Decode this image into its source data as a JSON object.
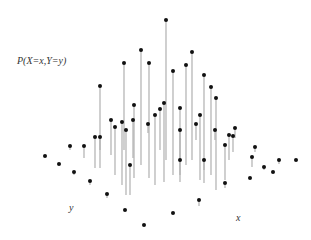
{
  "chart_data": {
    "type": "stem3d",
    "title": "",
    "zlabel": "P(X=x,Y=y)",
    "xlabel": "x",
    "ylabel": "y",
    "grid": false,
    "stem_color": "#b0b0b0",
    "marker_color": "#111111",
    "points": [
      {
        "x": 166,
        "top": 20,
        "base": 160
      },
      {
        "x": 141,
        "top": 50,
        "base": 165
      },
      {
        "x": 192,
        "top": 52,
        "base": 160
      },
      {
        "x": 124,
        "top": 63,
        "base": 150
      },
      {
        "x": 186,
        "top": 65,
        "base": 165
      },
      {
        "x": 173,
        "top": 71,
        "base": 175
      },
      {
        "x": 204,
        "top": 75,
        "base": 170
      },
      {
        "x": 149,
        "top": 63,
        "base": 178
      },
      {
        "x": 211,
        "top": 87,
        "base": 175
      },
      {
        "x": 100,
        "top": 86,
        "base": 150
      },
      {
        "x": 164,
        "top": 103,
        "base": 182
      },
      {
        "x": 134,
        "top": 105,
        "base": 178
      },
      {
        "x": 216,
        "top": 98,
        "base": 190
      },
      {
        "x": 160,
        "top": 109,
        "base": 150
      },
      {
        "x": 155,
        "top": 115,
        "base": 185
      },
      {
        "x": 180,
        "top": 108,
        "base": 160
      },
      {
        "x": 200,
        "top": 115,
        "base": 180
      },
      {
        "x": 111,
        "top": 120,
        "base": 155
      },
      {
        "x": 122,
        "top": 122,
        "base": 185
      },
      {
        "x": 148,
        "top": 124,
        "base": 133
      },
      {
        "x": 180,
        "top": 130,
        "base": 175
      },
      {
        "x": 196,
        "top": 124,
        "base": 140
      },
      {
        "x": 215,
        "top": 130,
        "base": 140
      },
      {
        "x": 95,
        "top": 137,
        "base": 168
      },
      {
        "x": 100,
        "top": 137,
        "base": 168
      },
      {
        "x": 84,
        "top": 146,
        "base": 158
      },
      {
        "x": 115,
        "top": 127,
        "base": 175
      },
      {
        "x": 126,
        "top": 130,
        "base": 195
      },
      {
        "x": 133,
        "top": 120,
        "base": 158
      },
      {
        "x": 229,
        "top": 135,
        "base": 160
      },
      {
        "x": 233,
        "top": 136,
        "base": 152
      },
      {
        "x": 225,
        "top": 145,
        "base": 180
      },
      {
        "x": 235,
        "top": 128,
        "base": 138
      },
      {
        "x": 204,
        "top": 160,
        "base": 183
      },
      {
        "x": 130,
        "top": 165,
        "base": 195
      },
      {
        "x": 180,
        "top": 160,
        "base": 182
      },
      {
        "x": 255,
        "top": 147,
        "base": 152
      },
      {
        "x": 252,
        "top": 157,
        "base": 167
      },
      {
        "x": 70,
        "top": 146,
        "base": 150
      },
      {
        "x": 45,
        "top": 156,
        "base": 156
      },
      {
        "x": 59,
        "top": 164,
        "base": 164
      },
      {
        "x": 74,
        "top": 172,
        "base": 175
      },
      {
        "x": 90,
        "top": 181,
        "base": 185
      },
      {
        "x": 107,
        "top": 194,
        "base": 198
      },
      {
        "x": 125,
        "top": 210,
        "base": 210
      },
      {
        "x": 144,
        "top": 225,
        "base": 225
      },
      {
        "x": 173,
        "top": 213,
        "base": 213
      },
      {
        "x": 199,
        "top": 200,
        "base": 206
      },
      {
        "x": 225,
        "top": 183,
        "base": 188
      },
      {
        "x": 250,
        "top": 178,
        "base": 178
      },
      {
        "x": 273,
        "top": 172,
        "base": 172
      },
      {
        "x": 296,
        "top": 160,
        "base": 160
      },
      {
        "x": 279,
        "top": 160,
        "base": 164
      },
      {
        "x": 264,
        "top": 167,
        "base": 170
      }
    ]
  },
  "labels": {
    "z": "P(X=x,Y=y)",
    "x": "x",
    "y": "y"
  }
}
